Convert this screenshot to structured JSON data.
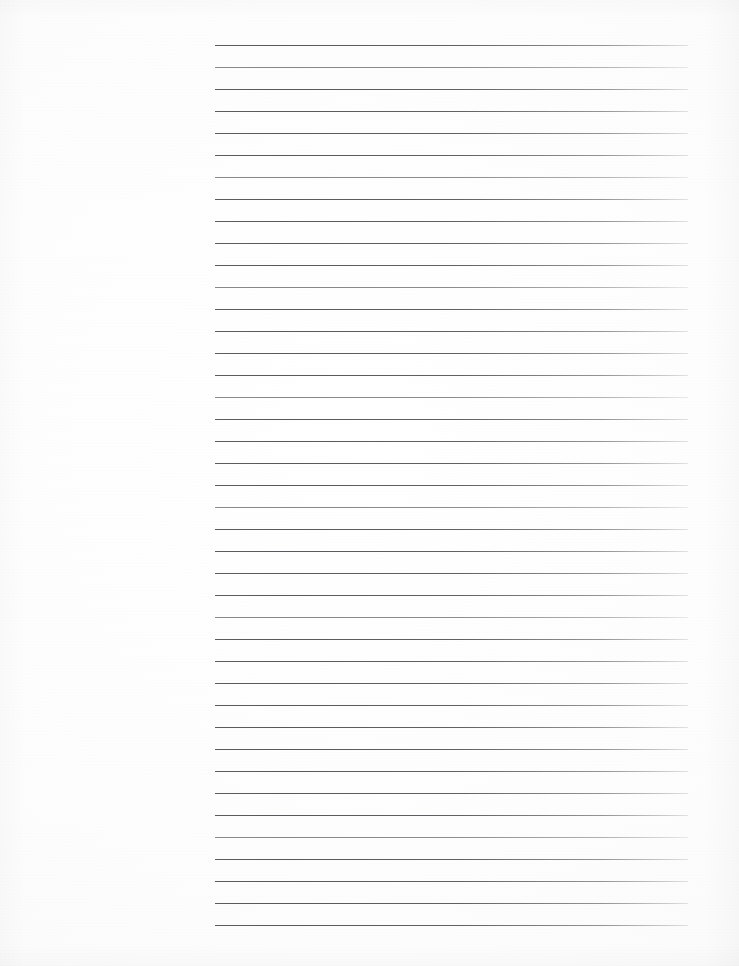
{
  "document": {
    "type": "blank-ruled-notebook-page",
    "page_width": 739,
    "page_height": 966,
    "paper_color": "#fdfdfd",
    "scan_note": ""
  },
  "ruling": {
    "line_color": "#4e4e52",
    "line_count": 41,
    "first_line_y": 45,
    "line_spacing": 22,
    "line_left_x": 215,
    "line_right_x": 688,
    "line_width": 473,
    "line_thickness": 1
  },
  "margin": {
    "left_margin_width": 215,
    "left_margin_label": "",
    "top_margin_height": 45,
    "bottom_margin_height": 41
  },
  "bleed_through": {
    "present": true,
    "legible": false,
    "text": "",
    "opacity": 0.055
  },
  "content": {
    "written_text": "",
    "heading": "",
    "page_number": ""
  }
}
